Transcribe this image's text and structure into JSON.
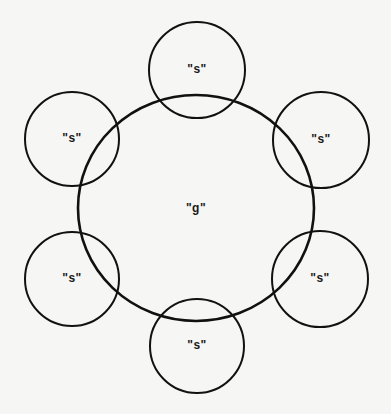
{
  "diagram": {
    "stroke_color": "#111111",
    "background": "#f6f6f4",
    "central": {
      "label": "\"g\"",
      "cx": 196,
      "cy": 208,
      "rx": 118,
      "ry": 113,
      "stroke_width": 2.6
    },
    "satellites": [
      {
        "id": "top",
        "label": "\"s\"",
        "cx": 197,
        "cy": 70,
        "r": 48
      },
      {
        "id": "upper-right",
        "label": "\"s\"",
        "cx": 321,
        "cy": 140,
        "r": 48
      },
      {
        "id": "lower-right",
        "label": "\"s\"",
        "cx": 320,
        "cy": 279,
        "r": 48
      },
      {
        "id": "bottom",
        "label": "\"s\"",
        "cx": 197,
        "cy": 346,
        "r": 47
      },
      {
        "id": "lower-left",
        "label": "\"s\"",
        "cx": 72,
        "cy": 279,
        "r": 47
      },
      {
        "id": "upper-left",
        "label": "\"s\"",
        "cx": 72,
        "cy": 139,
        "r": 47
      }
    ],
    "satellite_stroke_width": 2
  }
}
